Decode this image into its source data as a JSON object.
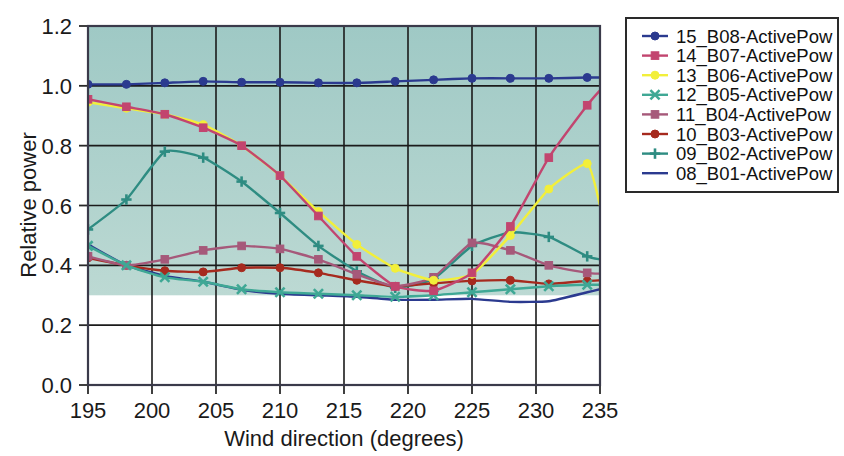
{
  "chart_data": {
    "type": "line",
    "title": "",
    "xlabel": "Wind direction (degrees)",
    "ylabel": "Relative power",
    "xlim": [
      195,
      235
    ],
    "ylim": [
      0.0,
      1.2
    ],
    "xticks": [
      195,
      200,
      205,
      210,
      215,
      220,
      225,
      230,
      235
    ],
    "yticks": [
      "0.0",
      "0.2",
      "0.4",
      "0.6",
      "0.8",
      "1.0",
      "1.2"
    ],
    "grid": "both",
    "legend_position": "right",
    "plot_background": "#a9cfca",
    "x": [
      195,
      198,
      201,
      204,
      207,
      210,
      213,
      216,
      219,
      222,
      225,
      228,
      231,
      234,
      235
    ],
    "series": [
      {
        "name": "15_B08-ActivePow",
        "color": "#2b3a8f",
        "marker": "circle",
        "values": [
          1.005,
          1.005,
          1.01,
          1.015,
          1.012,
          1.012,
          1.01,
          1.01,
          1.015,
          1.02,
          1.025,
          1.025,
          1.025,
          1.028,
          1.028
        ]
      },
      {
        "name": "14_B07-ActivePow",
        "color": "#c2456f",
        "marker": "square",
        "values": [
          0.955,
          0.93,
          0.905,
          0.86,
          0.8,
          0.7,
          0.565,
          0.43,
          0.33,
          0.315,
          0.375,
          0.53,
          0.76,
          0.935,
          0.985
        ]
      },
      {
        "name": "13_B06-ActivePow",
        "color": "#f2ef3a",
        "marker": "circle",
        "values": [
          0.945,
          0.925,
          0.905,
          0.87,
          0.8,
          0.7,
          0.58,
          0.47,
          0.39,
          0.35,
          0.37,
          0.5,
          0.655,
          0.74,
          0.6
        ]
      },
      {
        "name": "12_B05-ActivePow",
        "color": "#3fa895",
        "marker": "cross",
        "values": [
          0.465,
          0.4,
          0.36,
          0.345,
          0.32,
          0.31,
          0.305,
          0.3,
          0.295,
          0.3,
          0.31,
          0.32,
          0.33,
          0.335,
          0.335
        ]
      },
      {
        "name": "11_B04-ActivePow",
        "color": "#a6597a",
        "marker": "square",
        "values": [
          0.43,
          0.4,
          0.42,
          0.45,
          0.465,
          0.455,
          0.42,
          0.37,
          0.33,
          0.36,
          0.475,
          0.45,
          0.4,
          0.375,
          0.372
        ]
      },
      {
        "name": "10_B03-ActivePow",
        "color": "#a62a1e",
        "marker": "circle",
        "values": [
          0.425,
          0.4,
          0.382,
          0.378,
          0.392,
          0.392,
          0.375,
          0.35,
          0.33,
          0.34,
          0.348,
          0.35,
          0.338,
          0.348,
          0.35
        ]
      },
      {
        "name": "09_B02-ActivePow",
        "color": "#2e8c82",
        "marker": "plus",
        "values": [
          0.52,
          0.62,
          0.78,
          0.76,
          0.68,
          0.575,
          0.465,
          0.38,
          0.325,
          0.355,
          0.465,
          0.51,
          0.495,
          0.43,
          0.42
        ]
      },
      {
        "name": "08_B01-ActivePow",
        "color": "#2b3a8f",
        "marker": "none",
        "values": [
          0.47,
          0.4,
          0.365,
          0.345,
          0.318,
          0.305,
          0.3,
          0.295,
          0.285,
          0.285,
          0.288,
          0.278,
          0.28,
          0.31,
          0.32
        ]
      }
    ]
  },
  "legend": {
    "entries": [
      {
        "label": "15_B08-ActivePow",
        "color": "#2b3a8f",
        "marker": "circle"
      },
      {
        "label": "14_B07-ActivePow",
        "color": "#c2456f",
        "marker": "square"
      },
      {
        "label": "13_B06-ActivePow",
        "color": "#f2ef3a",
        "marker": "circle"
      },
      {
        "label": "12_B05-ActivePow",
        "color": "#3fa895",
        "marker": "cross"
      },
      {
        "label": "11_B04-ActivePow",
        "color": "#a6597a",
        "marker": "square"
      },
      {
        "label": "10_B03-ActivePow",
        "color": "#a62a1e",
        "marker": "circle"
      },
      {
        "label": "09_B02-ActivePow",
        "color": "#2e8c82",
        "marker": "plus"
      },
      {
        "label": "08_B01-ActivePow",
        "color": "#2b3a8f",
        "marker": "none"
      }
    ]
  }
}
